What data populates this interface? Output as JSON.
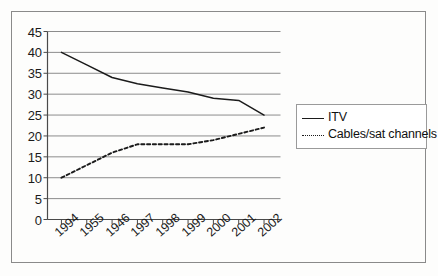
{
  "chart_data": {
    "type": "line",
    "title": "",
    "subtitle": "",
    "xlabel": "",
    "ylabel": "",
    "categories": [
      "1994",
      "1955",
      "1946",
      "1997",
      "1998",
      "1999",
      "2000",
      "2001",
      "2002"
    ],
    "ylim": [
      0,
      45
    ],
    "ytick_labels": [
      "0",
      "5",
      "10",
      "15",
      "20",
      "25",
      "30",
      "35",
      "40",
      "45"
    ],
    "ytick_values": [
      0,
      5,
      10,
      15,
      20,
      25,
      30,
      35,
      40,
      45
    ],
    "grid": true,
    "grid_axis": "y",
    "legend_position": "right",
    "series": [
      {
        "name": "ITV",
        "style": "solid",
        "color": "#1b1b1b",
        "values": [
          40,
          37,
          34,
          32.5,
          31.5,
          30.5,
          29,
          28.5,
          25
        ]
      },
      {
        "name": "Cables/sat channels",
        "style": "dotted",
        "color": "#1b1b1b",
        "values": [
          10,
          13,
          16,
          18,
          18,
          18,
          19,
          20.5,
          22
        ]
      }
    ]
  },
  "legend": {
    "items": [
      {
        "label": "ITV",
        "style": "solid"
      },
      {
        "label": "Cables/sat channels",
        "style": "dotted"
      }
    ]
  },
  "colors": {
    "ink": "#1b1b1b",
    "grid": "#8c8c8c",
    "axis": "#4a4a4a",
    "frame": "#8a8a8a",
    "background": "#ffffff"
  }
}
